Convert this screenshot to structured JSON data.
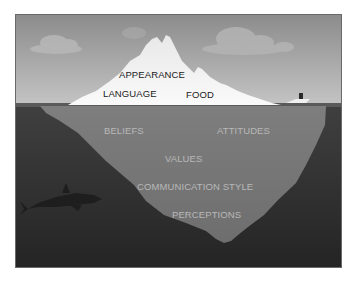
{
  "diagram": {
    "type": "iceberg",
    "colors": {
      "sky_top": "#8a8a8a",
      "sky_bottom": "#c2c2c2",
      "iceberg_top": "#f4f4f4",
      "water_line": "#4a4a4a",
      "water": "#3a3a3a",
      "water_deep": "#262626",
      "iceberg_submerged": "#7a7a7a",
      "above_text": "#1a1a1a",
      "below_text": "#b8b8b8"
    },
    "above_water": {
      "labels": [
        "APPEARANCE",
        "LANGUAGE",
        "FOOD"
      ]
    },
    "below_water": {
      "labels": [
        "BELIEFS",
        "ATTITUDES",
        "VALUES",
        "COMMUNICATION STYLE",
        "PERCEPTIONS"
      ]
    },
    "decorations": [
      "cloud-left",
      "cloud-center",
      "cloud-right",
      "shark",
      "boat"
    ]
  }
}
